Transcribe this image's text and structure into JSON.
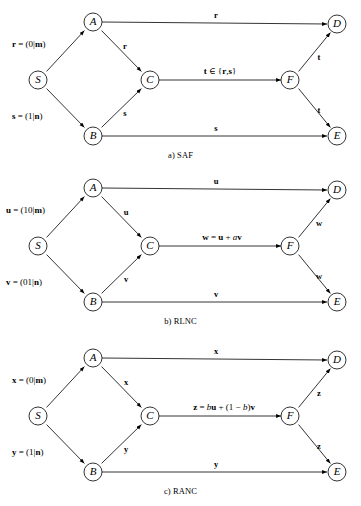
{
  "figure": {
    "panels": [
      {
        "id": "saf",
        "caption": "a) SAF",
        "nodes": [
          {
            "name": "S",
            "label": "S"
          },
          {
            "name": "A",
            "label": "A"
          },
          {
            "name": "B",
            "label": "B"
          },
          {
            "name": "C",
            "label": "C"
          },
          {
            "name": "F",
            "label": "F"
          },
          {
            "name": "D",
            "label": "D"
          },
          {
            "name": "E",
            "label": "E"
          }
        ],
        "side_labels": [
          {
            "name": "source-r",
            "text": "r = (0|m)"
          },
          {
            "name": "source-s",
            "text": "s = (1|n)"
          }
        ],
        "edge_labels": [
          {
            "name": "edge-A-D",
            "text": "r"
          },
          {
            "name": "edge-A-C",
            "text": "r"
          },
          {
            "name": "edge-B-C",
            "text": "s"
          },
          {
            "name": "edge-C-F",
            "text": "t ∈ {r, s}"
          },
          {
            "name": "edge-F-D",
            "text": "t"
          },
          {
            "name": "edge-F-E",
            "text": "t"
          },
          {
            "name": "edge-B-E",
            "text": "s"
          }
        ]
      },
      {
        "id": "rlnc",
        "caption": "b) RLNC",
        "nodes": [
          {
            "name": "S",
            "label": "S"
          },
          {
            "name": "A",
            "label": "A"
          },
          {
            "name": "B",
            "label": "B"
          },
          {
            "name": "C",
            "label": "C"
          },
          {
            "name": "F",
            "label": "F"
          },
          {
            "name": "D",
            "label": "D"
          },
          {
            "name": "E",
            "label": "E"
          }
        ],
        "side_labels": [
          {
            "name": "source-u",
            "text": "u = (10|m)"
          },
          {
            "name": "source-v",
            "text": "v = (01|n)"
          }
        ],
        "edge_labels": [
          {
            "name": "edge-A-D",
            "text": "u"
          },
          {
            "name": "edge-A-C",
            "text": "u"
          },
          {
            "name": "edge-B-C",
            "text": "v"
          },
          {
            "name": "edge-C-F",
            "text": "w = u + av"
          },
          {
            "name": "edge-F-D",
            "text": "w"
          },
          {
            "name": "edge-F-E",
            "text": "w"
          },
          {
            "name": "edge-B-E",
            "text": "v"
          }
        ]
      },
      {
        "id": "ranc",
        "caption": "c) RANC",
        "nodes": [
          {
            "name": "S",
            "label": "S"
          },
          {
            "name": "A",
            "label": "A"
          },
          {
            "name": "B",
            "label": "B"
          },
          {
            "name": "C",
            "label": "C"
          },
          {
            "name": "F",
            "label": "F"
          },
          {
            "name": "D",
            "label": "D"
          },
          {
            "name": "E",
            "label": "E"
          }
        ],
        "side_labels": [
          {
            "name": "source-x",
            "text": "x = (0|m)"
          },
          {
            "name": "source-y",
            "text": "y = (1|n)"
          }
        ],
        "edge_labels": [
          {
            "name": "edge-A-D",
            "text": "x"
          },
          {
            "name": "edge-A-C",
            "text": "x"
          },
          {
            "name": "edge-B-C",
            "text": "y"
          },
          {
            "name": "edge-C-F",
            "text": "z = bu + (1 − b)v"
          },
          {
            "name": "edge-F-D",
            "text": "z"
          },
          {
            "name": "edge-F-E",
            "text": "z"
          },
          {
            "name": "edge-B-E",
            "text": "y"
          }
        ]
      }
    ],
    "colors": {
      "stroke": "#000000",
      "background": "#ffffff"
    }
  }
}
